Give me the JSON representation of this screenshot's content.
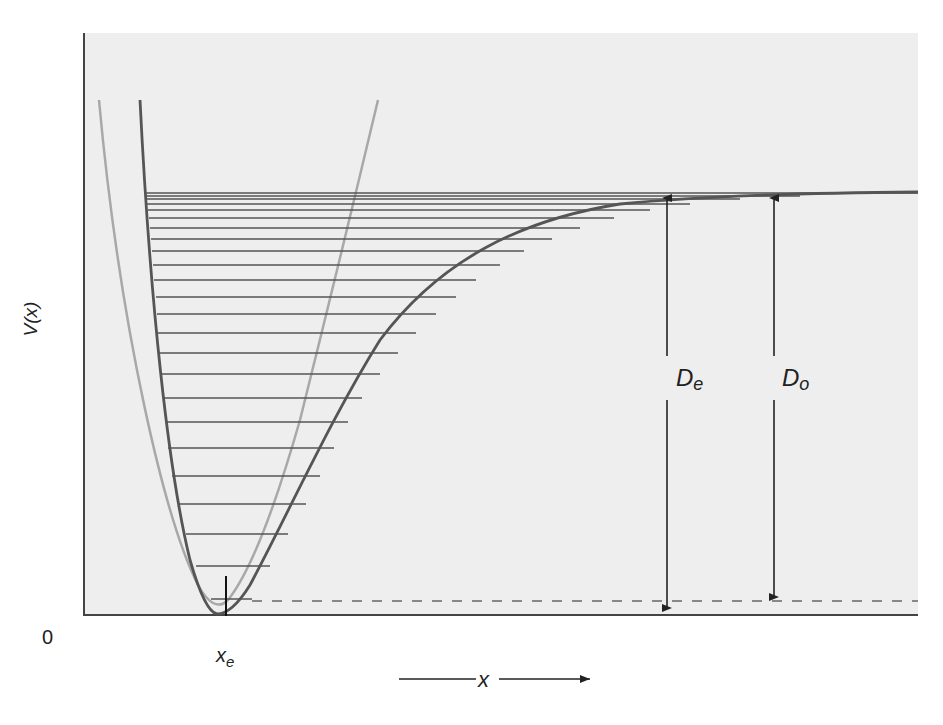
{
  "figure": {
    "type": "Morse potential energy diagram with vibrational levels and harmonic approximation",
    "y_axis_label": "V(x)",
    "origin_label": "0",
    "equilibrium_label_main": "x",
    "equilibrium_label_sub": "e",
    "x_axis_label": "x",
    "De_label_main": "D",
    "De_label_sub": "e",
    "Do_label_main": "D",
    "Do_label_sub": "o",
    "colors": {
      "background_panel": "#eeeeee",
      "morse_curve": "#555555",
      "harmonic_curve": "#a8a8a8",
      "levels": "#555555",
      "axis": "#444444",
      "arrows": "#222222",
      "dashed_zero_point": "#888888"
    },
    "vibrational_level_count": 24
  }
}
